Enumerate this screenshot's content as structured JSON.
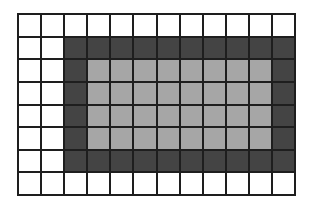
{
  "diagram": {
    "type": "grid",
    "rows": 8,
    "cols": 12,
    "colors": {
      "white": "#ffffff",
      "dark": "#444444",
      "light": "#a6a6a6",
      "gridline": "#1e1e1e"
    },
    "cells": [
      [
        "white",
        "white",
        "white",
        "white",
        "white",
        "white",
        "white",
        "white",
        "white",
        "white",
        "white",
        "white"
      ],
      [
        "white",
        "white",
        "dark",
        "dark",
        "dark",
        "dark",
        "dark",
        "dark",
        "dark",
        "dark",
        "dark",
        "dark"
      ],
      [
        "white",
        "white",
        "dark",
        "light",
        "light",
        "light",
        "light",
        "light",
        "light",
        "light",
        "light",
        "dark"
      ],
      [
        "white",
        "white",
        "dark",
        "light",
        "light",
        "light",
        "light",
        "light",
        "light",
        "light",
        "light",
        "dark"
      ],
      [
        "white",
        "white",
        "dark",
        "light",
        "light",
        "light",
        "light",
        "light",
        "light",
        "light",
        "light",
        "dark"
      ],
      [
        "white",
        "white",
        "dark",
        "light",
        "light",
        "light",
        "light",
        "light",
        "light",
        "light",
        "light",
        "dark"
      ],
      [
        "white",
        "white",
        "dark",
        "dark",
        "dark",
        "dark",
        "dark",
        "dark",
        "dark",
        "dark",
        "dark",
        "dark"
      ],
      [
        "white",
        "white",
        "white",
        "white",
        "white",
        "white",
        "white",
        "white",
        "white",
        "white",
        "white",
        "white"
      ]
    ],
    "summary": {
      "outer_rectangle": {
        "col_start": 3,
        "col_end": 12,
        "row_start": 2,
        "row_end": 7,
        "color": "dark"
      },
      "inner_rectangle": {
        "col_start": 4,
        "col_end": 11,
        "row_start": 3,
        "row_end": 6,
        "color": "light"
      }
    }
  }
}
